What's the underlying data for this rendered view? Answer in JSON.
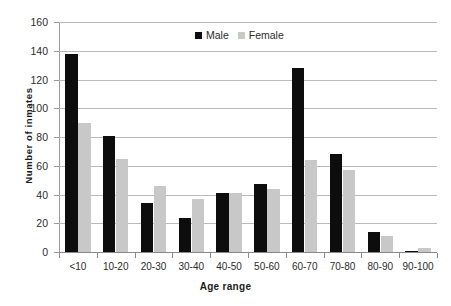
{
  "chart_data": {
    "type": "bar",
    "title": "",
    "xlabel": "Age range",
    "ylabel": "Number of inmates",
    "categories": [
      "<10",
      "10-20",
      "20-30",
      "30-40",
      "40-50",
      "50-60",
      "60-70",
      "70-80",
      "80-90",
      "90-100"
    ],
    "series": [
      {
        "name": "Male",
        "color": "#0d0d0d",
        "values": [
          138,
          81,
          34,
          24,
          41,
          47,
          128,
          68,
          14,
          1
        ]
      },
      {
        "name": "Female",
        "color": "#c8c8c8",
        "values": [
          90,
          65,
          46,
          37,
          41,
          44,
          64,
          57,
          11,
          3
        ]
      }
    ],
    "ylim": [
      0,
      160
    ],
    "ytick_step": 20,
    "yticks": [
      "0",
      "20",
      "40",
      "60",
      "80",
      "100",
      "120",
      "140",
      "160"
    ],
    "grid": "horizontal",
    "legend_position": "top-center"
  },
  "legend": {
    "male_label": "Male",
    "female_label": "Female"
  },
  "axes": {
    "x_title": "Age range",
    "y_title": "Number of inmates"
  }
}
